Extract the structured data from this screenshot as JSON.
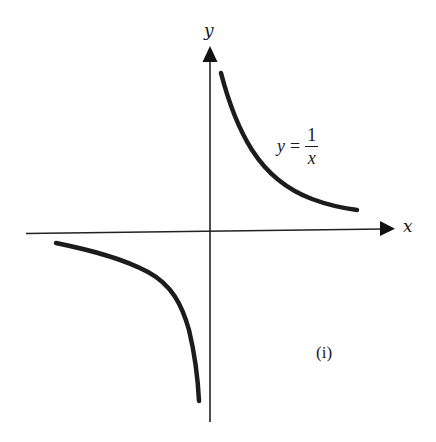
{
  "figure": {
    "type": "diagram",
    "caption_tag": "(i)",
    "axes": {
      "x_label": "x",
      "y_label": "y",
      "color": "#222222"
    },
    "curve": {
      "label_lhs": "y",
      "label_eq": "=",
      "label_num": "1",
      "label_den": "x",
      "color": "#1c1c1c",
      "branches": [
        {
          "name": "first-quadrant-branch",
          "x_range": "x > 0"
        },
        {
          "name": "third-quadrant-branch",
          "x_range": "x < 0"
        }
      ]
    }
  }
}
